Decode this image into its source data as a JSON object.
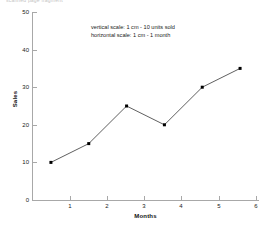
{
  "page": {
    "header_remnant": "scanned page fragment"
  },
  "chart_data": {
    "type": "line",
    "title": "",
    "xlabel": "Months",
    "ylabel": "Sales",
    "x": [
      1,
      2,
      3,
      4,
      5,
      6
    ],
    "values": [
      10,
      15,
      25,
      20,
      30,
      35
    ],
    "series": [
      {
        "name": "Sales",
        "values": [
          10,
          15,
          25,
          20,
          30,
          35
        ]
      }
    ],
    "xlim": [
      0.5,
      6.5
    ],
    "ylim": [
      0,
      50
    ],
    "xticks": [
      "1",
      "2",
      "3",
      "4",
      "5",
      "6"
    ],
    "yticks": [
      "0",
      "10",
      "20",
      "30",
      "40",
      "50"
    ],
    "grid": false,
    "legend": false,
    "marker": "square",
    "line_color": "#1a1a1a",
    "marker_color": "#000000",
    "axis_color": "#a8a8a8",
    "annotations": [
      "vertical scale: 1 cm - 10 units sold",
      "horizontal scale: 1 cm - 1 month"
    ]
  }
}
